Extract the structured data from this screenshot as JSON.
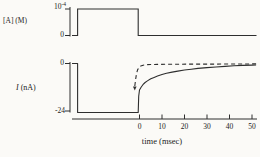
{
  "colors": {
    "background": "#fbfaf7",
    "line": "#2e2e2e",
    "text": "#1c1c1c"
  },
  "xlabel": "time (msec)",
  "chart_data": [
    {
      "type": "line",
      "panel": "top",
      "ylabel": "[A] (M)",
      "yticks": [
        {
          "label_base": "10",
          "label_exponent": "-4",
          "value": 0.0001
        },
        {
          "label_base": "0",
          "label_exponent": "",
          "value": 0
        }
      ],
      "xlim": [
        -30,
        52
      ],
      "series": [
        {
          "name": "concentration-pulse",
          "style": "solid",
          "points": [
            [
              -30,
              0
            ],
            [
              -27.5,
              0
            ],
            [
              -27.5,
              0.0001
            ],
            [
              -0.6,
              0.0001
            ],
            [
              -0.6,
              0
            ],
            [
              52,
              0
            ]
          ]
        }
      ]
    },
    {
      "type": "line",
      "panel": "bottom",
      "ylabel": "I (nA)",
      "ylabel_symbol": "I",
      "ylabel_unit": "(nA)",
      "xlabel": "time (msec)",
      "yticks": [
        {
          "label": "0",
          "value": 0
        },
        {
          "label": "-24",
          "value": -24
        }
      ],
      "xticks": [
        0,
        10,
        20,
        30,
        40,
        50
      ],
      "xlim": [
        -30,
        52
      ],
      "ylim": [
        -24.5,
        0.5
      ],
      "series": [
        {
          "name": "solid-trace",
          "style": "solid",
          "points": [
            [
              -30,
              0
            ],
            [
              -27.5,
              0
            ],
            [
              -27.5,
              -24
            ],
            [
              -0.6,
              -24
            ],
            [
              -0.35,
              -16
            ],
            [
              0,
              -13
            ],
            [
              0.7,
              -11.6
            ],
            [
              1.5,
              -10.4
            ],
            [
              2.5,
              -9.3
            ],
            [
              3.5,
              -8.5
            ],
            [
              5,
              -7.5
            ],
            [
              6.5,
              -6.8
            ],
            [
              8,
              -6.1
            ],
            [
              10,
              -5.4
            ],
            [
              12,
              -4.8
            ],
            [
              14.5,
              -4.2
            ],
            [
              17,
              -3.7
            ],
            [
              20,
              -3.2
            ],
            [
              23,
              -2.8
            ],
            [
              26,
              -2.4
            ],
            [
              30,
              -2.0
            ],
            [
              34,
              -1.7
            ],
            [
              38,
              -1.4
            ],
            [
              42,
              -1.15
            ],
            [
              46,
              -0.95
            ],
            [
              50,
              -0.8
            ],
            [
              51.8,
              -0.75
            ]
          ]
        },
        {
          "name": "dashed-trace",
          "style": "dashed",
          "arrow_at_start": true,
          "points": [
            [
              -2.1,
              -11
            ],
            [
              -1.7,
              -7.5
            ],
            [
              -1.3,
              -4.8
            ],
            [
              -0.8,
              -3.0
            ],
            [
              -0.2,
              -1.9
            ],
            [
              0.6,
              -1.2
            ],
            [
              1.6,
              -0.85
            ],
            [
              3,
              -0.6
            ],
            [
              5,
              -0.5
            ],
            [
              8,
              -0.45
            ],
            [
              12,
              -0.4
            ],
            [
              18,
              -0.35
            ],
            [
              25,
              -0.3
            ],
            [
              33,
              -0.27
            ],
            [
              41,
              -0.23
            ],
            [
              51.8,
              -0.2
            ]
          ]
        }
      ]
    }
  ]
}
